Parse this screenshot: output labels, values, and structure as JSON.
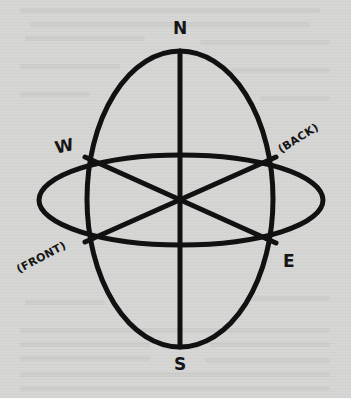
{
  "diagram": {
    "type": "directional-orientation-diagram",
    "labels": {
      "north": "N",
      "south": "S",
      "west": "W",
      "east": "E",
      "back": "(BACK)",
      "front": "(FRONT)"
    },
    "colors": {
      "background": "#d6d6d4",
      "stroke": "#111111",
      "text": "#151515"
    },
    "shapes": {
      "vertical_ellipse": {
        "cx": 180,
        "cy": 199,
        "rx": 93,
        "ry": 148
      },
      "horizontal_ellipse": {
        "cx": 181,
        "cy": 200,
        "rx": 142,
        "ry": 45
      },
      "vertical_axis": {
        "x1": 180,
        "y1": 51,
        "x2": 180,
        "y2": 347
      },
      "diagonal_w_e": {
        "x1": 85,
        "y1": 157,
        "x2": 276,
        "y2": 243
      },
      "diagonal_front_back": {
        "x1": 85,
        "y1": 242,
        "x2": 276,
        "y2": 157
      }
    }
  }
}
